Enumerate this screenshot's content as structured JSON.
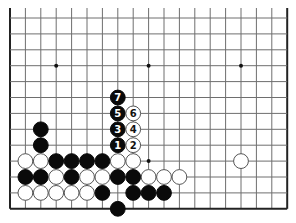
{
  "board": {
    "columns": 19,
    "rows_visible": 13,
    "origin_x": 10,
    "origin_y": 18,
    "spacing_x": 15.4,
    "spacing_y": 15.9,
    "top_edge_open": true,
    "line_color": "#6e6e6e",
    "border_color": "#222222",
    "stone_black": "#0a0a0a",
    "stone_white": "#ffffff",
    "star_points": [
      {
        "col": 3,
        "row": 3
      },
      {
        "col": 9,
        "row": 3
      },
      {
        "col": 15,
        "row": 3
      },
      {
        "col": 9,
        "row": 9
      }
    ]
  },
  "stones": [
    {
      "color": "black",
      "col": 2,
      "row": 7
    },
    {
      "color": "black",
      "col": 2,
      "row": 8
    },
    {
      "color": "black",
      "col": 7,
      "row": 5,
      "label": "7"
    },
    {
      "color": "black",
      "col": 7,
      "row": 6,
      "label": "5"
    },
    {
      "color": "white",
      "col": 8,
      "row": 6,
      "label": "6"
    },
    {
      "color": "black",
      "col": 7,
      "row": 7,
      "label": "3"
    },
    {
      "color": "white",
      "col": 8,
      "row": 7,
      "label": "4"
    },
    {
      "color": "black",
      "col": 7,
      "row": 8,
      "label": "1"
    },
    {
      "color": "white",
      "col": 8,
      "row": 8,
      "label": "2"
    },
    {
      "color": "white",
      "col": 1,
      "row": 9
    },
    {
      "color": "white",
      "col": 2,
      "row": 9
    },
    {
      "color": "black",
      "col": 3,
      "row": 9
    },
    {
      "color": "black",
      "col": 4,
      "row": 9
    },
    {
      "color": "black",
      "col": 5,
      "row": 9
    },
    {
      "color": "black",
      "col": 6,
      "row": 9
    },
    {
      "color": "white",
      "col": 7,
      "row": 9
    },
    {
      "color": "white",
      "col": 8,
      "row": 9
    },
    {
      "color": "white",
      "col": 15,
      "row": 9
    },
    {
      "color": "black",
      "col": 1,
      "row": 10
    },
    {
      "color": "black",
      "col": 2,
      "row": 10
    },
    {
      "color": "white",
      "col": 3,
      "row": 10
    },
    {
      "color": "black",
      "col": 4,
      "row": 10
    },
    {
      "color": "white",
      "col": 5,
      "row": 10
    },
    {
      "color": "white",
      "col": 6,
      "row": 10
    },
    {
      "color": "black",
      "col": 7,
      "row": 10
    },
    {
      "color": "black",
      "col": 8,
      "row": 10
    },
    {
      "color": "white",
      "col": 9,
      "row": 10
    },
    {
      "color": "white",
      "col": 10,
      "row": 10
    },
    {
      "color": "white",
      "col": 11,
      "row": 10
    },
    {
      "color": "white",
      "col": 1,
      "row": 11
    },
    {
      "color": "white",
      "col": 2,
      "row": 11
    },
    {
      "color": "white",
      "col": 3,
      "row": 11
    },
    {
      "color": "white",
      "col": 4,
      "row": 11
    },
    {
      "color": "white",
      "col": 5,
      "row": 11
    },
    {
      "color": "black",
      "col": 6,
      "row": 11
    },
    {
      "color": "black",
      "col": 8,
      "row": 11
    },
    {
      "color": "black",
      "col": 9,
      "row": 11
    },
    {
      "color": "black",
      "col": 10,
      "row": 11
    },
    {
      "color": "black",
      "col": 7,
      "row": 12
    }
  ]
}
